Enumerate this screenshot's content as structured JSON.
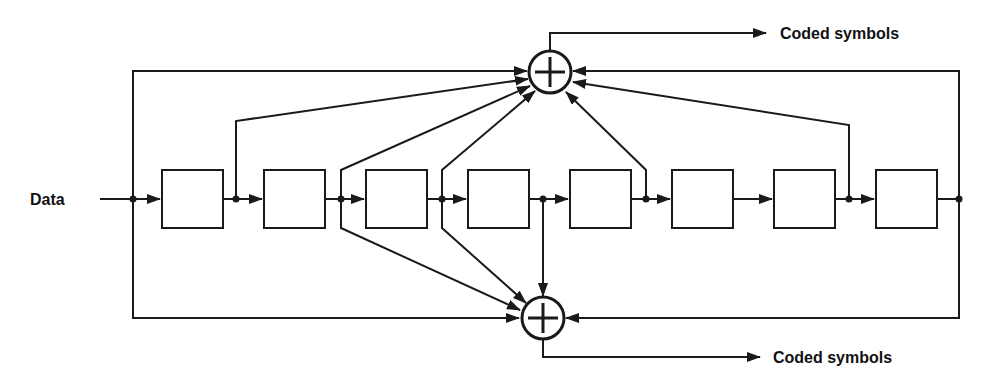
{
  "diagram": {
    "title": "",
    "input_label": "Data",
    "output_top_label": "Coded symbols",
    "output_bottom_label": "Coded symbols",
    "shift_register_stages": 8,
    "adders": [
      {
        "id": "top-xor",
        "symbol": "⊕"
      },
      {
        "id": "bottom-xor",
        "symbol": "⊕"
      }
    ],
    "colors": {
      "line": "#1a1a1a",
      "background": "#ffffff"
    }
  }
}
